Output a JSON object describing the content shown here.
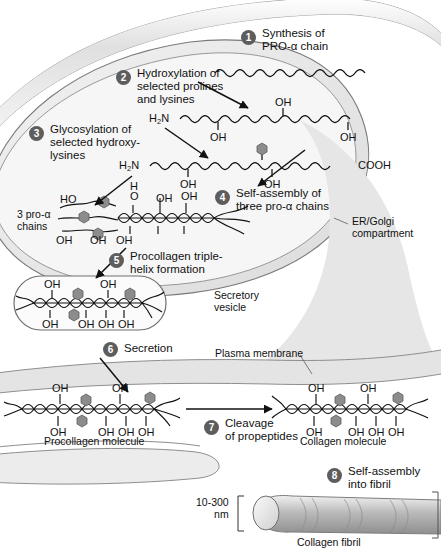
{
  "figure": {
    "compartments": [
      {
        "name": "ER/Golgi compartment",
        "label": "ER/Golgi\ncompartment"
      },
      {
        "name": "Secretory vesicle",
        "label": "Secretory\nvesicle"
      },
      {
        "name": "Plasma membrane",
        "label": "Plasma membrane"
      }
    ]
  },
  "steps": [
    {
      "n": "1",
      "label": "Synthesis of\nPRO-α chain"
    },
    {
      "n": "2",
      "label": "Hydroxylation of\nselected prolines\nand lysines"
    },
    {
      "n": "3",
      "label": "Glycosylation of\nselected hydroxy-\nlysines"
    },
    {
      "n": "4",
      "label": "Self-assembly of\nthree pro-α chains"
    },
    {
      "n": "5",
      "label": "Procollagen triple-\nhelix formation"
    },
    {
      "n": "6",
      "label": "Secretion"
    },
    {
      "n": "7",
      "label": "Cleavage\nof propeptides"
    },
    {
      "n": "8",
      "label": "Self-assembly\ninto fibril"
    }
  ],
  "annotations": {
    "er_golgi": "ER/Golgi\ncompartment",
    "secretory_vesicle": "Secretory\nvesicle",
    "plasma_membrane": "Plasma membrane",
    "three_pro_alpha": "3 pro-α\nchains",
    "procollagen_molecule": "Procollagen molecule",
    "collagen_molecule": "Collagen molecule",
    "collagen_fibril": "Collagen fibril",
    "fibril_diameter": "10-300\nnm"
  },
  "chem_labels": {
    "amino_terminus": "H2N",
    "carboxyl_terminus": "COOH",
    "hydroxyl": "OH",
    "hydroxyl_h": "H",
    "hydroxyl_o": "O",
    "hydroxyl_ho": "HO"
  },
  "chain1_marks": [],
  "chain2_marks": [
    "OH",
    "OH",
    "OH"
  ],
  "chain3_marks": [
    "OH",
    "OH"
  ],
  "helix_assembly_marks": [
    "HO",
    "OH",
    "OH",
    "OH"
  ],
  "vesicle_marks": [
    "OH",
    "OH",
    "OH",
    "OH",
    "OH"
  ],
  "procollagen_marks": [
    "OH",
    "OH",
    "OH",
    "OH",
    "OH"
  ],
  "collagen_marks": [
    "OH",
    "OH",
    "OH",
    "OH",
    "OH"
  ],
  "colors": {
    "sugar_hexagon": "#8c8c8c",
    "step_circle": "#5d5d5d",
    "cell_fill": "#e9e9e9",
    "outline": "#6b6b6b",
    "text": "#111111",
    "fibril": "#bdbdbd"
  }
}
